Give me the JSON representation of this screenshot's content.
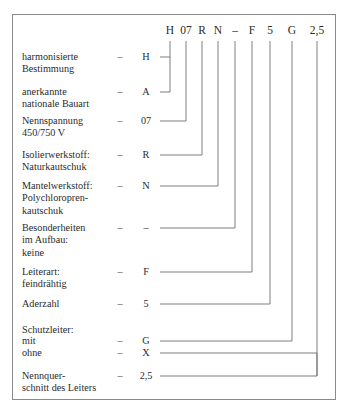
{
  "diagram": {
    "type": "designation-breakdown",
    "border_color": "#8a8a8a",
    "line_color": "#6f6f6f",
    "text_color": "#2b2b2b",
    "dash": "–",
    "code_string": "H 07 R N – F 5 G 2,5",
    "header_codes": [
      {
        "id": "h",
        "label": "H",
        "x": 170
      },
      {
        "id": "07",
        "label": "07",
        "x": 186
      },
      {
        "id": "r",
        "label": "R",
        "x": 202
      },
      {
        "id": "n",
        "label": "N",
        "x": 218
      },
      {
        "id": "dash",
        "label": "–",
        "x": 235
      },
      {
        "id": "f",
        "label": "F",
        "x": 252
      },
      {
        "id": "5",
        "label": "5",
        "x": 270
      },
      {
        "id": "g",
        "label": "G",
        "x": 292
      },
      {
        "id": "25",
        "label": "2,5",
        "x": 317
      }
    ],
    "rows": [
      {
        "id": "harmonisiert",
        "label": "harmonisierte\nBestimmung",
        "dash": "–",
        "code": "H",
        "y": 57
      },
      {
        "id": "national",
        "label": "anerkannte\nnationale Bauart",
        "dash": "–",
        "code": "A",
        "y": 92
      },
      {
        "id": "nennspannung",
        "label": "Nennspannung\n450/750 V",
        "dash": "–",
        "code": "07",
        "y": 121
      },
      {
        "id": "isolierwerkstoff",
        "label": "Isolierwerkstoff:\nNaturkautschuk",
        "dash": "–",
        "code": "R",
        "y": 155
      },
      {
        "id": "mantelwerkstoff",
        "label": "Mantelwerkstoff:\nPolychloropren-\nkautschuk",
        "dash": "–",
        "code": "N",
        "y": 186
      },
      {
        "id": "besonderheiten",
        "label": "Besonderheiten\nim Aufbau:\nkeine",
        "dash": "–",
        "code": "–",
        "y": 228
      },
      {
        "id": "leiterart",
        "label": "Leiterart:\nfeindrähtig",
        "dash": "–",
        "code": "F",
        "y": 272
      },
      {
        "id": "aderzahl",
        "label": "Aderzahl",
        "dash": "–",
        "code": "5",
        "y": 304
      },
      {
        "id": "schutzleiter",
        "label": "Schutzleiter:",
        "dash": "",
        "code": "",
        "y": 330
      },
      {
        "id": "schutzleiter-mit",
        "label": "mit",
        "dash": "–",
        "code": "G",
        "y": 341
      },
      {
        "id": "schutzleiter-ohne",
        "label": "ohne",
        "dash": "–",
        "code": "X",
        "y": 353
      },
      {
        "id": "nennquerschnitt",
        "label": "Nennquer-\nschnitt des Leiters",
        "dash": "–",
        "code": "2,5",
        "y": 376
      }
    ]
  }
}
